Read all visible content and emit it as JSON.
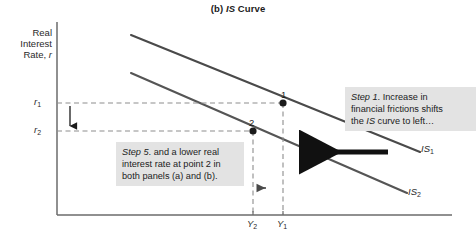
{
  "title": {
    "prefix": "(b) ",
    "italic": "IS",
    "suffix": " Curve"
  },
  "axes": {
    "y_label_line1": "Real",
    "y_label_line2": "Interest",
    "y_label_line3_prefix": "Rate, ",
    "y_label_line3_italic": "r",
    "y_ticks": [
      {
        "base": "r",
        "sub": "1"
      },
      {
        "base": "r",
        "sub": "2"
      }
    ],
    "x_ticks": [
      {
        "base": "Y",
        "sub": "2"
      },
      {
        "base": "Y",
        "sub": "1"
      }
    ]
  },
  "curves": [
    {
      "name": "IS1",
      "base": "IS",
      "sub": "1",
      "color": "#4a4a4a"
    },
    {
      "name": "IS2",
      "base": "IS",
      "sub": "2",
      "color": "#555555"
    }
  ],
  "points": [
    {
      "label": "1",
      "x_tick": "Y1",
      "y_tick": "r1"
    },
    {
      "label": "2",
      "x_tick": "Y2",
      "y_tick": "r2"
    }
  ],
  "callouts": {
    "step1": {
      "step_italic": "Step 1",
      "line1_rest": ". Increase in",
      "line2": "financial frictions shifts",
      "line3_prefix": "the ",
      "line3_italic": "IS",
      "line3_suffix": " curve to left…"
    },
    "step5": {
      "step_italic": "Step 5",
      "line1_rest": ". and a lower real",
      "line2": "interest rate at point 2 in",
      "line3": "both panels (a) and (b)."
    }
  },
  "colors": {
    "axis": "#6b6b6b",
    "curve_dark": "#3a3a3a",
    "curve_light": "#555555",
    "dashed": "#8d8d8d",
    "shift_arrow": "#111111",
    "callout_bg": "#e3e3e3",
    "text": "#1b1b1b"
  }
}
